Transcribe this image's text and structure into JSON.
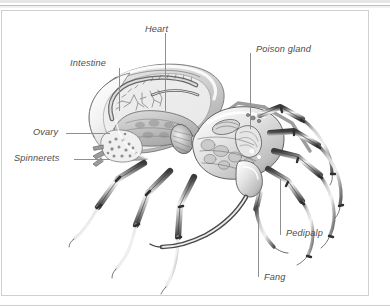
{
  "figure": {
    "caption": "",
    "labels": [
      {
        "id": "heart",
        "text": "Heart",
        "x": 143,
        "y": 22
      },
      {
        "id": "intestine",
        "text": "Intestine",
        "x": 68,
        "y": 56
      },
      {
        "id": "poison-gland",
        "text": "Poison gland",
        "x": 255,
        "y": 43
      },
      {
        "id": "ovary",
        "text": "Ovary",
        "x": 31,
        "y": 118
      },
      {
        "id": "spinnerets",
        "text": "Spinnerets",
        "x": 13,
        "y": 145
      },
      {
        "id": "pedipalp",
        "text": "Pedipalp",
        "x": 285,
        "y": 222
      },
      {
        "id": "fang",
        "text": "Fang",
        "x": 262,
        "y": 265
      }
    ],
    "colors": {
      "background": "#ffffff",
      "panel_border": "#d0d0d0",
      "label_text": "#4c4c4c",
      "leader_line": "#8f8f8f",
      "ink_dark": "#2b2b2b",
      "ink_mid": "#7d7d7d",
      "ink_light": "#cfcfcf"
    }
  }
}
